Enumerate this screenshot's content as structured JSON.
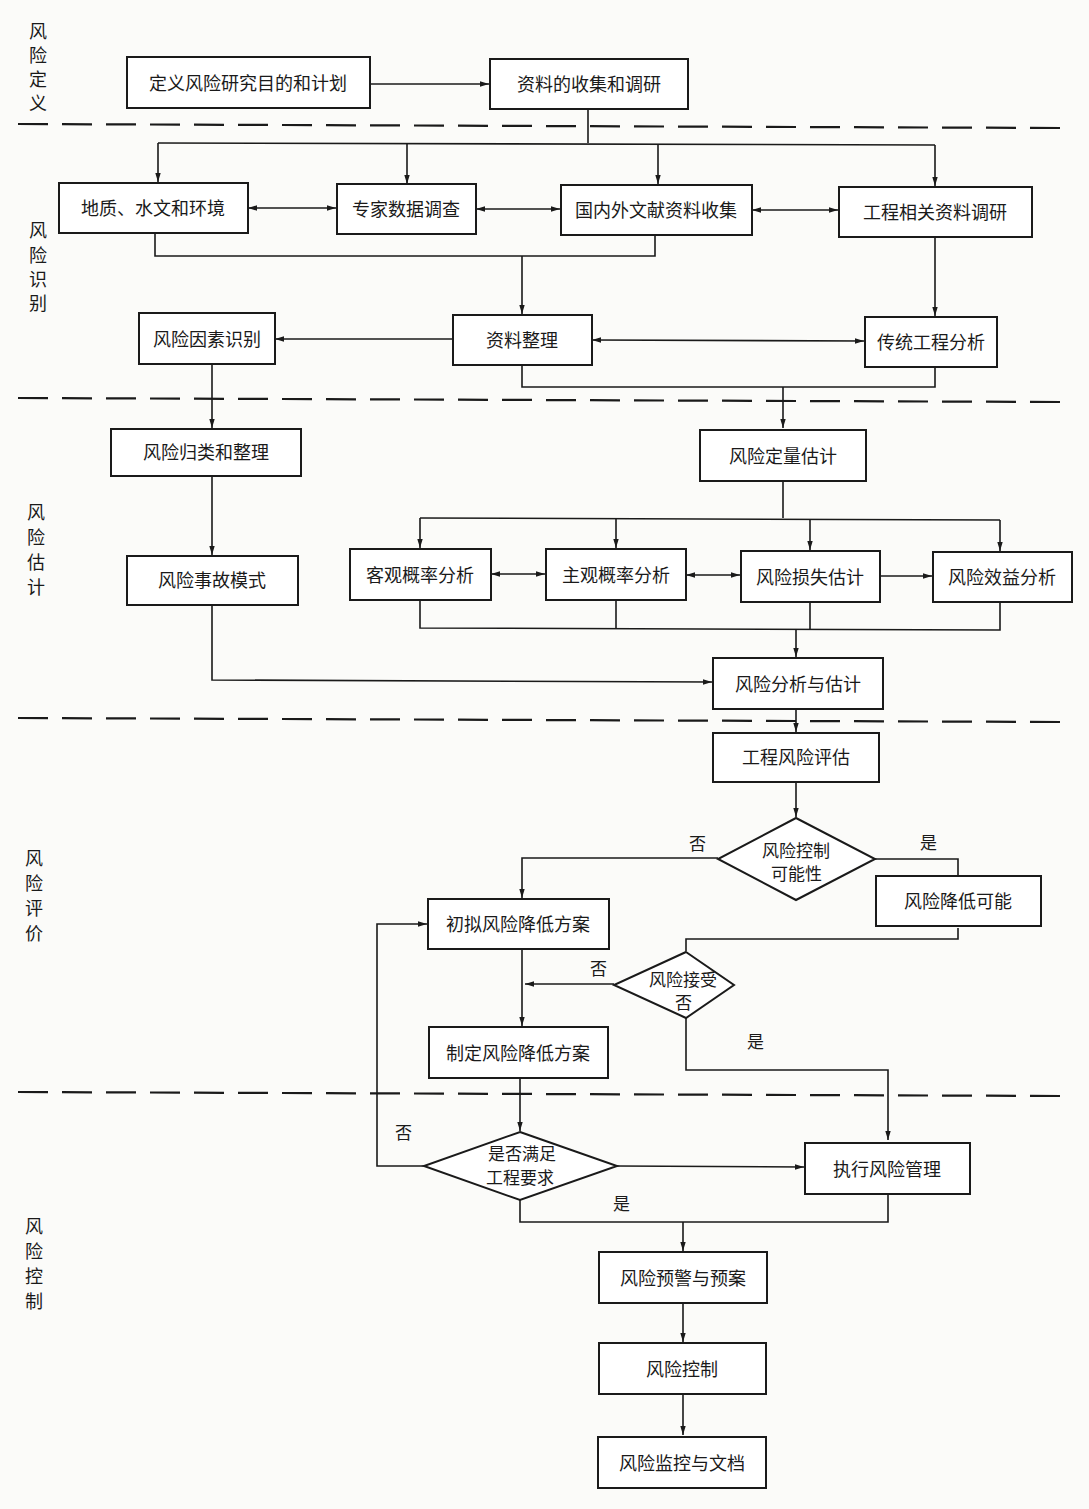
{
  "stages": [
    {
      "id": "define",
      "label": "风险定义",
      "chars": [
        "风",
        "险",
        "定",
        "义"
      ]
    },
    {
      "id": "identify",
      "label": "风险识别",
      "chars": [
        "风",
        "险",
        "识",
        "别"
      ]
    },
    {
      "id": "estimate",
      "label": "风险估计",
      "chars": [
        "风",
        "险",
        "估",
        "计"
      ]
    },
    {
      "id": "evaluate",
      "label": "风险评价",
      "chars": [
        "风",
        "险",
        "评",
        "价"
      ]
    },
    {
      "id": "control",
      "label": "风险控制",
      "chars": [
        "风",
        "险",
        "控",
        "制"
      ]
    }
  ],
  "nodes": {
    "define_plan": "定义风险研究目的和计划",
    "data_collect": "资料的收集和调研",
    "geo_env": "地质、水文和环境",
    "expert_survey": "专家数据调查",
    "literature": "国内外文献资料收集",
    "project_data": "工程相关资料调研",
    "factor_identify": "风险因素识别",
    "data_organize": "资料整理",
    "traditional_analysis": "传统工程分析",
    "classify": "风险归类和整理",
    "quant_estimate": "风险定量估计",
    "accident_mode": "风险事故模式",
    "objective_prob": "客观概率分析",
    "subjective_prob": "主观概率分析",
    "loss_estimate": "风险损失估计",
    "benefit_analysis": "风险效益分析",
    "analysis_estimate": "风险分析与估计",
    "project_eval": "工程风险评估",
    "control_possible": [
      "风险控制",
      "可能性"
    ],
    "reduce_possible": "风险降低可能",
    "draft_plan": "初拟风险降低方案",
    "accept": [
      "风险接受",
      "否"
    ],
    "make_plan": "制定风险降低方案",
    "meet_req": [
      "是否满足",
      "工程要求"
    ],
    "exec_mgmt": "执行风险管理",
    "warning": "风险预警与预案",
    "control": "风险控制",
    "monitor": "风险监控与文档"
  },
  "edge_labels": {
    "control_no": "否",
    "control_yes": "是",
    "accept_no": "否",
    "accept_yes": "是",
    "meet_no": "否",
    "meet_yes": "是"
  }
}
